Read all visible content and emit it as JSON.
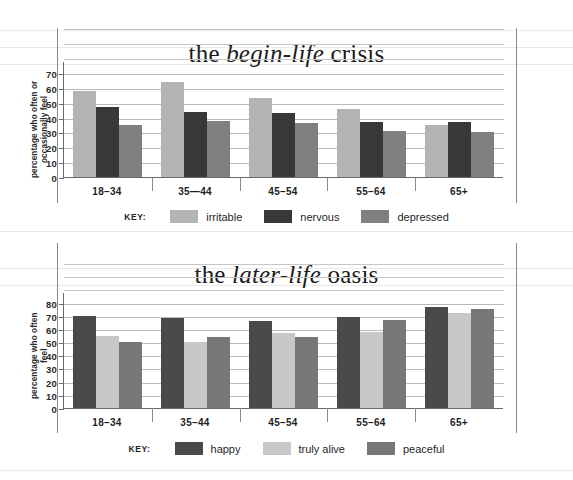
{
  "page": {
    "background": "#ffffff",
    "sheet_rule_color": "#d8d8d8"
  },
  "charts": [
    {
      "id": "begin-life-crisis",
      "title_prefix": "the ",
      "title_em": "begin-life",
      "title_suffix": " crisis",
      "title_full": "the begin-life crisis",
      "ylabel": "percentage who often or occasionally feel",
      "key_word": "KEY:",
      "yticks": [
        0,
        10,
        20,
        30,
        40,
        50,
        60,
        70
      ],
      "ymax": 78,
      "categories": [
        "18–34",
        "35—44",
        "45–54",
        "55–64",
        "65+"
      ],
      "series": [
        {
          "name": "irritable",
          "color": "#b3b3b3",
          "values": [
            58,
            64,
            53,
            46,
            35
          ]
        },
        {
          "name": "nervous",
          "color": "#383838",
          "values": [
            47,
            44,
            43,
            37,
            37
          ]
        },
        {
          "name": "depressed",
          "color": "#808080",
          "values": [
            35,
            38,
            36,
            31,
            30
          ]
        }
      ]
    },
    {
      "id": "later-life-oasis",
      "title_prefix": "the ",
      "title_em": "later-life",
      "title_suffix": " oasis",
      "title_full": "the later-life oasis",
      "ylabel": "percentage who often feel",
      "key_word": "KEY:",
      "yticks": [
        0,
        10,
        20,
        30,
        40,
        50,
        60,
        70,
        80
      ],
      "ymax": 88,
      "categories": [
        "18–34",
        "35–44",
        "45–54",
        "55–64",
        "65+"
      ],
      "series": [
        {
          "name": "happy",
          "color": "#4a4a4a",
          "values": [
            70,
            68,
            66,
            69,
            77
          ]
        },
        {
          "name": "truly alive",
          "color": "#c8c8c8",
          "values": [
            55,
            50,
            57,
            58,
            72
          ]
        },
        {
          "name": "peaceful",
          "color": "#777777",
          "values": [
            50,
            54,
            54,
            67,
            75
          ]
        }
      ]
    }
  ],
  "chart_data": [
    {
      "type": "bar",
      "title": "the begin-life crisis",
      "xlabel": "",
      "ylabel": "percentage who often or occasionally feel",
      "categories": [
        "18-34",
        "35-44",
        "45-54",
        "55-64",
        "65+"
      ],
      "series": [
        {
          "name": "irritable",
          "values": [
            58,
            64,
            53,
            46,
            35
          ]
        },
        {
          "name": "nervous",
          "values": [
            47,
            44,
            43,
            37,
            37
          ]
        },
        {
          "name": "depressed",
          "values": [
            35,
            38,
            36,
            31,
            30
          ]
        }
      ],
      "ylim": [
        0,
        70
      ],
      "ytick_step": 10,
      "grid": true,
      "legend_position": "bottom"
    },
    {
      "type": "bar",
      "title": "the later-life oasis",
      "xlabel": "",
      "ylabel": "percentage who often feel",
      "categories": [
        "18-34",
        "35-44",
        "45-54",
        "55-64",
        "65+"
      ],
      "series": [
        {
          "name": "happy",
          "values": [
            70,
            68,
            66,
            69,
            77
          ]
        },
        {
          "name": "truly alive",
          "values": [
            55,
            50,
            57,
            58,
            72
          ]
        },
        {
          "name": "peaceful",
          "values": [
            50,
            54,
            54,
            67,
            75
          ]
        }
      ],
      "ylim": [
        0,
        80
      ],
      "ytick_step": 10,
      "grid": true,
      "legend_position": "bottom"
    }
  ]
}
